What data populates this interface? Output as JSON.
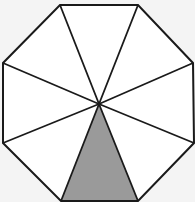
{
  "diagram": {
    "shape": "octagon",
    "segments": 8,
    "shaded_segments": 1,
    "shaded_position": "bottom",
    "colors": {
      "background": "#f4f4f4",
      "fill": "#ffffff",
      "shade": "#9a9a9a",
      "stroke": "#1a1a1a"
    },
    "vertices": [
      [
        60,
        5
      ],
      [
        138,
        5
      ],
      [
        193,
        63
      ],
      [
        194,
        143
      ],
      [
        138,
        201
      ],
      [
        61,
        201
      ],
      [
        3,
        143
      ],
      [
        3,
        63
      ]
    ],
    "center": [
      99,
      104
    ]
  }
}
